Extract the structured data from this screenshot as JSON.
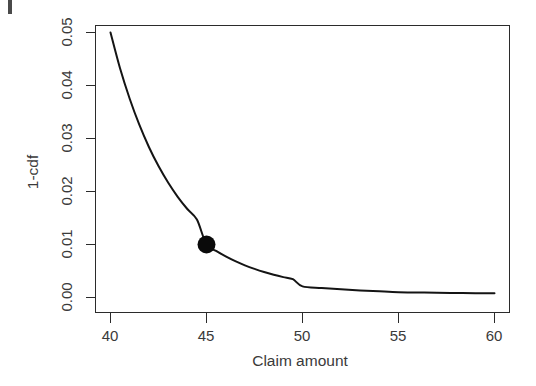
{
  "chart_data": {
    "type": "line",
    "title": "",
    "subtitle": "",
    "xlabel": "Claim amount",
    "ylabel": "1-cdf",
    "xlim": [
      40,
      60
    ],
    "ylim": [
      0.0,
      0.05
    ],
    "grid": false,
    "legend": null,
    "x_ticks": [
      40,
      45,
      50,
      55,
      60
    ],
    "x_tick_labels": [
      "40",
      "45",
      "50",
      "55",
      "60"
    ],
    "y_ticks": [
      0.0,
      0.01,
      0.02,
      0.03,
      0.04,
      0.05
    ],
    "y_tick_labels": [
      "0.00",
      "0.01",
      "0.02",
      "0.03",
      "0.04",
      "0.05"
    ],
    "series": [
      {
        "name": "1-cdf",
        "x": [
          40.0,
          40.5,
          41.0,
          41.5,
          42.0,
          42.5,
          43.0,
          43.5,
          44.0,
          44.5,
          45.0,
          45.5,
          46.0,
          46.5,
          47.0,
          47.5,
          48.0,
          48.5,
          49.0,
          49.5,
          50.0,
          51.0,
          52.0,
          53.0,
          54.0,
          55.0,
          56.0,
          57.0,
          58.0,
          59.0,
          60.0
        ],
        "y": [
          0.05,
          0.0432,
          0.0375,
          0.0326,
          0.0284,
          0.0248,
          0.0217,
          0.019,
          0.0167,
          0.0147,
          0.01,
          0.00878,
          0.00775,
          0.00685,
          0.00607,
          0.0054,
          0.00481,
          0.0043,
          0.00385,
          0.00345,
          0.0021,
          0.0018,
          0.00155,
          0.00134,
          0.00116,
          0.001,
          0.00095,
          0.0009,
          0.00086,
          0.00082,
          0.0008
        ]
      }
    ],
    "points": [
      {
        "label": "marked-point",
        "x": 45,
        "y": 0.01,
        "marker": "filled-circle",
        "color": "#0a0a0a",
        "size": 9
      }
    ],
    "colors": {
      "curve": "#141414",
      "point": "#0a0a0a",
      "axis": "#2b2b2b",
      "text": "#3a3a3a",
      "background": "#ffffff"
    }
  }
}
